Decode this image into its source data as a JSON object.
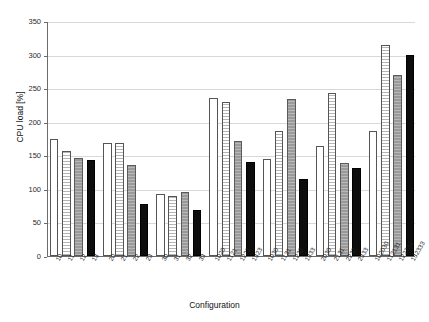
{
  "chart_data": {
    "type": "bar",
    "title": "",
    "xlabel": "Configuration",
    "ylabel": "CPU load [%]",
    "ylim": [
      0,
      350
    ],
    "yticks": [
      0,
      50,
      100,
      150,
      200,
      250,
      300,
      350
    ],
    "grid": true,
    "legend": "none",
    "categories": [
      "10",
      "11",
      "12",
      "13",
      "20",
      "21",
      "22",
      "23",
      "30",
      "31",
      "32",
      "33",
      "1020",
      "1121",
      "1222",
      "1323",
      "1030",
      "1131",
      "1232",
      "1333",
      "2030",
      "2131",
      "2232",
      "2333",
      "102030",
      "112131",
      "122232",
      "132333"
    ],
    "values": [
      174,
      156,
      146,
      143,
      168,
      168,
      136,
      78,
      93,
      90,
      96,
      69,
      236,
      229,
      172,
      140,
      144,
      186,
      234,
      115,
      164,
      243,
      138,
      131,
      186,
      315,
      270,
      300
    ],
    "bar_styles": [
      "white",
      "hatch",
      "gray",
      "black",
      "white",
      "hatch",
      "gray",
      "black",
      "white",
      "hatch",
      "gray",
      "black",
      "white",
      "hatch",
      "gray",
      "black",
      "white",
      "hatch",
      "gray",
      "black",
      "white",
      "hatch",
      "gray",
      "black",
      "white",
      "hatch",
      "gray",
      "black"
    ],
    "colors": {
      "white": "#ffffff",
      "hatch": "#ffffff",
      "gray": "#9a9a9a",
      "black": "#0d0d0d",
      "axis": "#6b6b6b",
      "grid": "#d8d8d8"
    }
  }
}
